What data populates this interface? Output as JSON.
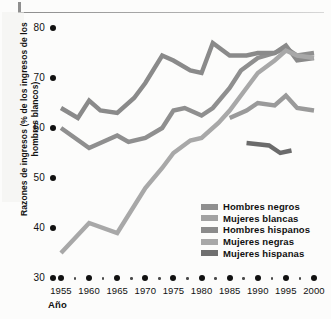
{
  "chart_data": {
    "type": "line",
    "title": "",
    "xlabel": "Año",
    "ylabel": "Razones de ingresos (% de los ingresos de los hombres blancos)",
    "xlim": [
      1955,
      2000
    ],
    "ylim": [
      30,
      80
    ],
    "grid": false,
    "legend_position": "inside-lower-right",
    "xticks": [
      1955,
      1960,
      1965,
      1970,
      1975,
      1980,
      1985,
      1990,
      1995,
      2000
    ],
    "yticks": [
      30,
      40,
      50,
      60,
      70,
      80
    ],
    "series": [
      {
        "name": "Hombres negros",
        "color": "#8f8f8f",
        "x": [
          1955,
          1960,
          1962,
          1965,
          1967,
          1970,
          1973,
          1975,
          1977,
          1980,
          1982,
          1985,
          1987,
          1990,
          1993,
          1995,
          1997,
          2000
        ],
        "values": [
          60.0,
          56.0,
          57.0,
          58.5,
          57.2,
          58.0,
          60.0,
          63.5,
          64.0,
          62.5,
          64.0,
          68.0,
          71.5,
          74.0,
          75.0,
          76.0,
          74.5,
          75.0
        ]
      },
      {
        "name": "Mujeres blancas",
        "color": "#8a8a8a",
        "x": [
          1955,
          1958,
          1960,
          1962,
          1965,
          1968,
          1970,
          1973,
          1975,
          1978,
          1980,
          1982,
          1985,
          1988,
          1990,
          1993,
          1995,
          1997,
          2000
        ],
        "values": [
          64.0,
          62.0,
          65.5,
          63.5,
          63.0,
          66.0,
          69.0,
          74.5,
          73.5,
          71.5,
          71.0,
          77.0,
          74.5,
          74.5,
          75.0,
          75.0,
          76.5,
          73.5,
          74.0
        ]
      },
      {
        "name": "Hombres hispanos",
        "color": "#9a9a9a",
        "x": [
          1985,
          1988,
          1990,
          1993,
          1995,
          1997,
          2000
        ],
        "values": [
          62.0,
          63.5,
          65.0,
          64.5,
          66.5,
          64.0,
          63.5
        ]
      },
      {
        "name": "Mujeres negras",
        "color": "#a8a8a8",
        "x": [
          1955,
          1960,
          1965,
          1970,
          1973,
          1975,
          1978,
          1980,
          1983,
          1985,
          1988,
          1990,
          1993,
          1995,
          1997,
          2000
        ],
        "values": [
          35.0,
          41.0,
          39.0,
          48.0,
          52.0,
          55.0,
          57.5,
          58.0,
          61.0,
          63.5,
          68.0,
          71.0,
          73.5,
          75.5,
          74.5,
          74.0
        ]
      },
      {
        "name": "Mujeres hispanas",
        "color": "#6b6b6b",
        "x": [
          1988,
          1992,
          1994,
          1996
        ],
        "values": [
          57.0,
          56.5,
          55.0,
          55.5
        ]
      }
    ]
  },
  "legend": {
    "items": [
      {
        "label": "Hombres negros",
        "color": "#8f8f8f"
      },
      {
        "label": "Mujeres blancas",
        "color": "#a2a2a2"
      },
      {
        "label": "Hombres hispanos",
        "color": "#8b8b8b"
      },
      {
        "label": "Mujeres negras",
        "color": "#a8a8a8"
      },
      {
        "label": "Mujeres hispanas",
        "color": "#6f6f6f"
      }
    ]
  }
}
